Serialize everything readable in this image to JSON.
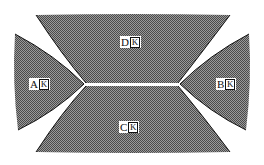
{
  "figure": {
    "fill_color": "#7a7a7a",
    "edge_color": "#111111",
    "slit_color": "#ffffff",
    "regions": [
      {
        "id": "D",
        "label": "D",
        "suffix": "K",
        "position": "top"
      },
      {
        "id": "A",
        "label": "A",
        "suffix": "K",
        "position": "left"
      },
      {
        "id": "B",
        "label": "B",
        "suffix": "K",
        "position": "right"
      },
      {
        "id": "C",
        "label": "C",
        "suffix": "K",
        "position": "bottom"
      }
    ]
  }
}
